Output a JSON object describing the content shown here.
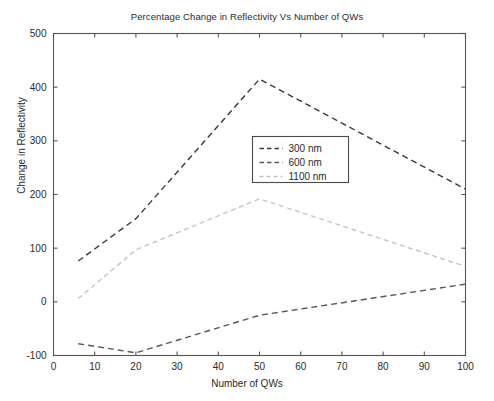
{
  "chart_data": {
    "type": "line",
    "title": "Percentage Change in Reflectivity Vs Number of QWs",
    "xlabel": "Number of QWs",
    "ylabel": "Change in Reflectivity",
    "xlim": [
      0,
      100
    ],
    "ylim": [
      -100,
      500
    ],
    "xticks": [
      0,
      10,
      20,
      30,
      40,
      50,
      60,
      70,
      80,
      90,
      100
    ],
    "yticks": [
      -100,
      0,
      100,
      200,
      300,
      400,
      500
    ],
    "grid": false,
    "legend_position": "center",
    "x": [
      6,
      20,
      50,
      100
    ],
    "series": [
      {
        "name": "300 nm",
        "values": [
          76,
          155,
          415,
          210
        ],
        "style": "dashed",
        "color": "#3a3a3a"
      },
      {
        "name": "600 nm",
        "values": [
          -78,
          -95,
          -25,
          33
        ],
        "style": "dashed",
        "color": "#585858"
      },
      {
        "name": "1100 nm",
        "values": [
          6,
          97,
          192,
          66
        ],
        "style": "dashed",
        "color": "#c2c2c2"
      }
    ]
  },
  "legend": {
    "entries": [
      "300 nm",
      "600 nm",
      "1100 nm"
    ]
  },
  "axis_labels": {
    "x": [
      "0",
      "10",
      "20",
      "30",
      "40",
      "50",
      "60",
      "70",
      "80",
      "90",
      "100"
    ],
    "y": [
      "500",
      "400",
      "300",
      "200",
      "100",
      "0",
      "-100"
    ]
  }
}
